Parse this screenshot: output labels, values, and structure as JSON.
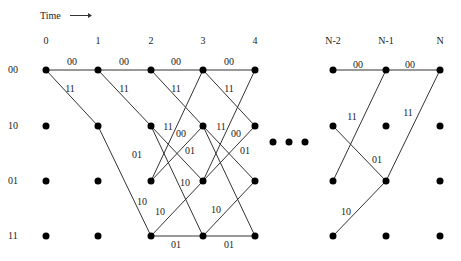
{
  "time_label": "Time",
  "time_arrow": "→",
  "columns": [
    {
      "label": "0",
      "x": 46
    },
    {
      "label": "1",
      "x": 98
    },
    {
      "label": "2",
      "x": 151
    },
    {
      "label": "3",
      "x": 203
    },
    {
      "label": "4",
      "x": 255
    },
    {
      "label": "N-2",
      "x": 333
    },
    {
      "label": "N-1",
      "x": 386
    },
    {
      "label": "N",
      "x": 440
    }
  ],
  "states": [
    {
      "label": "00",
      "y": 70
    },
    {
      "label": "10",
      "y": 126
    },
    {
      "label": "01",
      "y": 181
    },
    {
      "label": "11",
      "y": 236
    }
  ],
  "ellipsis": "• • •",
  "edges": [
    {
      "from": [
        0,
        0
      ],
      "to": [
        1,
        0
      ],
      "label": "00"
    },
    {
      "from": [
        0,
        0
      ],
      "to": [
        1,
        1
      ],
      "label": "11"
    },
    {
      "from": [
        1,
        0
      ],
      "to": [
        2,
        0
      ],
      "label": "00"
    },
    {
      "from": [
        1,
        0
      ],
      "to": [
        2,
        1
      ],
      "label": "11"
    },
    {
      "from": [
        1,
        1
      ],
      "to": [
        2,
        3
      ],
      "label": "10"
    },
    {
      "from": [
        2,
        0
      ],
      "to": [
        3,
        0
      ],
      "label": "00"
    },
    {
      "from": [
        2,
        0
      ],
      "to": [
        3,
        1
      ],
      "label": "11"
    },
    {
      "from": [
        2,
        1
      ],
      "to": [
        3,
        2
      ],
      "label": "01"
    },
    {
      "from": [
        2,
        1
      ],
      "to": [
        3,
        3
      ],
      "label": "10"
    },
    {
      "from": [
        2,
        2
      ],
      "to": [
        3,
        0
      ],
      "label": "11"
    },
    {
      "from": [
        2,
        2
      ],
      "to": [
        3,
        1
      ],
      "label": "00"
    },
    {
      "from": [
        2,
        3
      ],
      "to": [
        3,
        2
      ],
      "label": "10"
    },
    {
      "from": [
        2,
        3
      ],
      "to": [
        3,
        3
      ],
      "label": "01"
    },
    {
      "from": [
        3,
        0
      ],
      "to": [
        4,
        0
      ],
      "label": "00"
    },
    {
      "from": [
        3,
        0
      ],
      "to": [
        4,
        1
      ],
      "label": "11"
    },
    {
      "from": [
        3,
        1
      ],
      "to": [
        4,
        2
      ],
      "label": "01"
    },
    {
      "from": [
        3,
        1
      ],
      "to": [
        4,
        3
      ],
      "label": ""
    },
    {
      "from": [
        3,
        2
      ],
      "to": [
        4,
        0
      ],
      "label": "11"
    },
    {
      "from": [
        3,
        2
      ],
      "to": [
        4,
        1
      ],
      "label": "00"
    },
    {
      "from": [
        3,
        3
      ],
      "to": [
        4,
        2
      ],
      "label": "10"
    },
    {
      "from": [
        3,
        3
      ],
      "to": [
        4,
        3
      ],
      "label": "01"
    },
    {
      "from": [
        5,
        0
      ],
      "to": [
        6,
        0
      ],
      "label": "00"
    },
    {
      "from": [
        5,
        2
      ],
      "to": [
        6,
        0
      ],
      "label": "11"
    },
    {
      "from": [
        5,
        1
      ],
      "to": [
        6,
        2
      ],
      "label": "01"
    },
    {
      "from": [
        5,
        3
      ],
      "to": [
        6,
        2
      ],
      "label": "10"
    },
    {
      "from": [
        6,
        0
      ],
      "to": [
        7,
        0
      ],
      "label": "00"
    },
    {
      "from": [
        6,
        2
      ],
      "to": [
        7,
        0
      ],
      "label": "11"
    }
  ],
  "edge_labels": [
    {
      "text": "00",
      "x": 72,
      "y": 65
    },
    {
      "text": "11",
      "x": 70,
      "y": 92
    },
    {
      "text": "00",
      "x": 124,
      "y": 65
    },
    {
      "text": "11",
      "x": 124,
      "y": 92
    },
    {
      "text": "10",
      "x": 142,
      "y": 205
    },
    {
      "text": "00",
      "x": 176,
      "y": 65
    },
    {
      "text": "11",
      "x": 176,
      "y": 92
    },
    {
      "text": "01",
      "x": 137,
      "y": 158
    },
    {
      "text": "11",
      "x": 168,
      "y": 130
    },
    {
      "text": "00",
      "x": 181,
      "y": 137
    },
    {
      "text": "01",
      "x": 190,
      "y": 154
    },
    {
      "text": "10",
      "x": 185,
      "y": 186
    },
    {
      "text": "10",
      "x": 160,
      "y": 215
    },
    {
      "text": "01",
      "x": 176,
      "y": 248
    },
    {
      "text": "00",
      "x": 229,
      "y": 65
    },
    {
      "text": "11",
      "x": 229,
      "y": 92
    },
    {
      "text": "11",
      "x": 221,
      "y": 130
    },
    {
      "text": "00",
      "x": 236,
      "y": 137
    },
    {
      "text": "01",
      "x": 245,
      "y": 154
    },
    {
      "text": "10",
      "x": 216,
      "y": 213
    },
    {
      "text": "01",
      "x": 229,
      "y": 248
    },
    {
      "text": "00",
      "x": 358,
      "y": 68
    },
    {
      "text": "11",
      "x": 352,
      "y": 120
    },
    {
      "text": "01",
      "x": 377,
      "y": 163
    },
    {
      "text": "10",
      "x": 346,
      "y": 215
    },
    {
      "text": "00",
      "x": 410,
      "y": 68
    },
    {
      "text": "11",
      "x": 408,
      "y": 116
    }
  ]
}
